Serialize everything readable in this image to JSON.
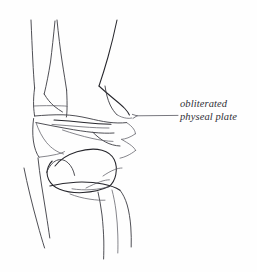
{
  "figure": {
    "name": "ankle-joint-line-drawing",
    "background_color": "#fefefe",
    "ink_color": "#3b3b42",
    "annotations": [
      {
        "id": "obliterated-physeal-plate",
        "lines": [
          "obliterated",
          "physeal plate"
        ],
        "text": "obliterated physeal plate",
        "leader": {
          "from_x": 178,
          "from_y": 115,
          "to_x": 132,
          "to_y": 116,
          "arrow": true
        }
      }
    ],
    "structures": [
      {
        "name": "fibula-shaft-lateral-border"
      },
      {
        "name": "fibula-shaft-medial-border"
      },
      {
        "name": "tibia-shaft-lateral-border"
      },
      {
        "name": "tibia-shaft-medial-border"
      },
      {
        "name": "medial-malleolus"
      },
      {
        "name": "lateral-malleolus"
      },
      {
        "name": "distal-tibial-articular-surface"
      },
      {
        "name": "obliterated-physeal-line"
      },
      {
        "name": "talar-dome"
      },
      {
        "name": "talus-body"
      },
      {
        "name": "calcaneus"
      },
      {
        "name": "soft-tissue-outline"
      }
    ]
  }
}
